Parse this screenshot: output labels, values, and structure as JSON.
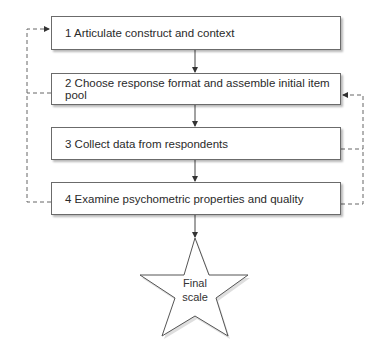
{
  "diagram": {
    "type": "flowchart",
    "steps": [
      {
        "id": 1,
        "label": "1 Articulate construct and context"
      },
      {
        "id": 2,
        "label": "2 Choose response format and assemble initial item pool"
      },
      {
        "id": 3,
        "label": "3 Collect data from respondents"
      },
      {
        "id": 4,
        "label": "4 Examine psychometric properties and quality"
      }
    ],
    "final": {
      "line1": "Final",
      "line2": "scale"
    },
    "edges": [
      {
        "from": 1,
        "to": 2,
        "style": "solid"
      },
      {
        "from": 2,
        "to": 3,
        "style": "solid"
      },
      {
        "from": 3,
        "to": 4,
        "style": "solid"
      },
      {
        "from": 4,
        "to": "final",
        "style": "solid"
      },
      {
        "from": 2,
        "to": 1,
        "style": "dashed",
        "side": "left"
      },
      {
        "from": 4,
        "to": 1,
        "style": "dashed",
        "side": "left"
      },
      {
        "from": 3,
        "to": 2,
        "style": "dashed",
        "side": "right"
      },
      {
        "from": 4,
        "to": 2,
        "style": "dashed",
        "side": "right"
      }
    ],
    "colors": {
      "line": "#444444",
      "dashed": "#666666",
      "border": "#6b6b6b"
    }
  }
}
